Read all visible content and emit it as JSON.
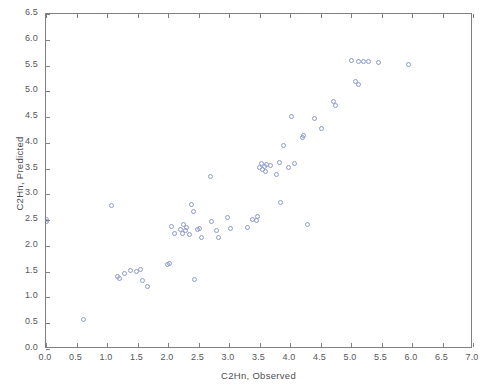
{
  "chart_data": {
    "type": "scatter",
    "title": "",
    "xlabel": "C2Hn, Observed",
    "ylabel": "C2Hn, Predicted",
    "xlim": [
      0.0,
      7.0
    ],
    "ylim": [
      0.0,
      6.5
    ],
    "xticks": [
      "0.0",
      "0.5",
      "1.0",
      "1.5",
      "2.0",
      "2.5",
      "3.0",
      "3.5",
      "4.0",
      "4.5",
      "5.0",
      "5.5",
      "6.0",
      "6.5",
      "7.0"
    ],
    "xtick_values": [
      0.0,
      0.5,
      1.0,
      1.5,
      2.0,
      2.5,
      3.0,
      3.5,
      4.0,
      4.5,
      5.0,
      5.5,
      6.0,
      6.5,
      7.0
    ],
    "yticks": [
      "0.0",
      "0.5",
      "1.0",
      "1.5",
      "2.0",
      "2.5",
      "3.0",
      "3.5",
      "4.0",
      "4.5",
      "5.0",
      "5.5",
      "6.0",
      "6.5"
    ],
    "ytick_values": [
      0.0,
      0.5,
      1.0,
      1.5,
      2.0,
      2.5,
      3.0,
      3.5,
      4.0,
      4.5,
      5.0,
      5.5,
      6.0,
      6.5
    ],
    "grid": false,
    "legend": null,
    "marker": "open-circle",
    "marker_color": "#8c9ad6",
    "series": [
      {
        "name": "C2Hn",
        "points": [
          [
            0.0,
            2.52
          ],
          [
            0.0,
            2.47
          ],
          [
            0.62,
            0.57
          ],
          [
            1.08,
            2.79
          ],
          [
            1.18,
            1.4
          ],
          [
            1.2,
            1.37
          ],
          [
            1.28,
            1.47
          ],
          [
            1.38,
            1.53
          ],
          [
            1.48,
            1.5
          ],
          [
            1.55,
            1.55
          ],
          [
            1.58,
            1.33
          ],
          [
            1.66,
            1.22
          ],
          [
            1.99,
            1.63
          ],
          [
            2.02,
            1.66
          ],
          [
            2.05,
            2.37
          ],
          [
            2.1,
            2.25
          ],
          [
            2.2,
            2.32
          ],
          [
            2.23,
            2.24
          ],
          [
            2.25,
            2.41
          ],
          [
            2.28,
            2.3
          ],
          [
            2.3,
            2.36
          ],
          [
            2.35,
            2.22
          ],
          [
            2.38,
            2.8
          ],
          [
            2.41,
            2.67
          ],
          [
            2.43,
            1.34
          ],
          [
            2.48,
            2.32
          ],
          [
            2.52,
            2.34
          ],
          [
            2.55,
            2.16
          ],
          [
            2.7,
            3.35
          ],
          [
            2.72,
            2.48
          ],
          [
            2.8,
            2.3
          ],
          [
            2.83,
            2.17
          ],
          [
            2.98,
            2.55
          ],
          [
            3.02,
            2.33
          ],
          [
            3.3,
            2.36
          ],
          [
            3.38,
            2.52
          ],
          [
            3.45,
            2.5
          ],
          [
            3.47,
            2.58
          ],
          [
            3.5,
            3.52
          ],
          [
            3.53,
            3.6
          ],
          [
            3.55,
            3.48
          ],
          [
            3.58,
            3.55
          ],
          [
            3.6,
            3.44
          ],
          [
            3.62,
            3.58
          ],
          [
            3.68,
            3.56
          ],
          [
            3.78,
            3.38
          ],
          [
            3.82,
            3.62
          ],
          [
            3.85,
            2.84
          ],
          [
            3.9,
            3.95
          ],
          [
            3.98,
            3.53
          ],
          [
            4.02,
            4.52
          ],
          [
            4.08,
            3.6
          ],
          [
            4.2,
            4.1
          ],
          [
            4.22,
            4.14
          ],
          [
            4.28,
            2.42
          ],
          [
            4.4,
            4.48
          ],
          [
            4.52,
            4.28
          ],
          [
            4.72,
            4.8
          ],
          [
            4.75,
            4.72
          ],
          [
            5.0,
            5.6
          ],
          [
            5.08,
            5.2
          ],
          [
            5.12,
            5.58
          ],
          [
            5.13,
            5.14
          ],
          [
            5.2,
            5.58
          ],
          [
            5.28,
            5.58
          ],
          [
            5.45,
            5.55
          ],
          [
            5.95,
            5.52
          ]
        ]
      }
    ]
  }
}
